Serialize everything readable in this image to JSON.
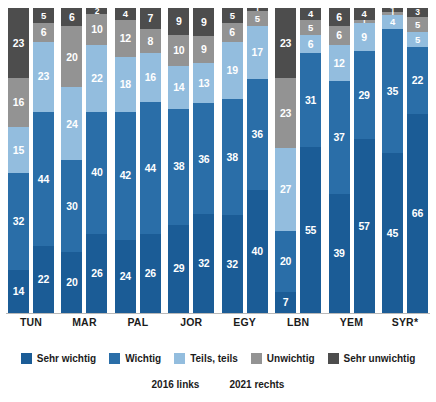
{
  "chart_data": {
    "type": "bar",
    "subtype": "stacked-100-percent-grouped",
    "title": "",
    "xlabel": "",
    "ylabel": "",
    "ylim": [
      0,
      100
    ],
    "grid": false,
    "legend_position": "bottom",
    "categories": [
      "TUN",
      "MAR",
      "PAL",
      "JOR",
      "EGY",
      "LBN",
      "YEM",
      "SYR*"
    ],
    "subgroups": [
      "2016 links",
      "2021 rechts"
    ],
    "series": [
      {
        "name": "Sehr wichtig",
        "color": "#1b5c96",
        "values_2016": [
          14,
          20,
          24,
          29,
          32,
          7,
          39,
          45
        ],
        "values_2021": [
          22,
          26,
          26,
          32,
          40,
          55,
          57,
          66
        ]
      },
      {
        "name": "Wichtig",
        "color": "#2a6ea8",
        "values_2016": [
          32,
          30,
          42,
          38,
          38,
          20,
          37,
          35
        ],
        "values_2021": [
          44,
          40,
          44,
          36,
          36,
          31,
          29,
          22
        ]
      },
      {
        "name": "Teils, teils",
        "color": "#93bdde",
        "values_2016": [
          15,
          24,
          18,
          14,
          19,
          27,
          12,
          4
        ],
        "values_2021": [
          23,
          22,
          16,
          13,
          17,
          6,
          9,
          5
        ]
      },
      {
        "name": "Unwichtig",
        "color": "#939393",
        "values_2016": [
          16,
          20,
          12,
          10,
          6,
          23,
          6,
          1
        ],
        "values_2021": [
          6,
          10,
          8,
          9,
          5,
          5,
          1,
          5
        ]
      },
      {
        "name": "Sehr unwichtig",
        "color": "#4d4d4d",
        "values_2016": [
          23,
          6,
          4,
          9,
          5,
          23,
          6,
          1
        ],
        "values_2021": [
          5,
          2,
          7,
          9,
          1,
          4,
          4,
          3
        ]
      }
    ]
  },
  "legend": {
    "items": [
      {
        "label": "Sehr wichtig",
        "color": "#1b5c96"
      },
      {
        "label": "Wichtig",
        "color": "#2a6ea8"
      },
      {
        "label": "Teils, teils",
        "color": "#93bdde"
      },
      {
        "label": "Unwichtig",
        "color": "#939393"
      },
      {
        "label": "Sehr unwichtig",
        "color": "#4d4d4d"
      }
    ]
  },
  "subnote": {
    "left": "2016 links",
    "right": "2021 rechts"
  }
}
